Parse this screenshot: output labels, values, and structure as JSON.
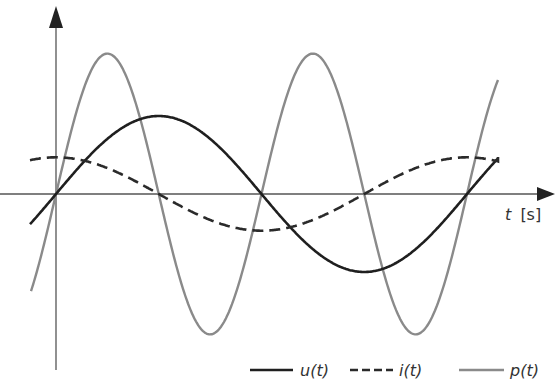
{
  "chart_data": {
    "type": "line",
    "title": "",
    "xlabel": "t [s]",
    "ylabel": "",
    "grid": false,
    "legend_position": "bottom-right",
    "x_range_periods": [
      -0.06,
      1.08
    ],
    "series": [
      {
        "name": "u(t)",
        "style": "solid",
        "color": "#1f1f1f",
        "function": "A·sin(ωt)",
        "amplitude": 1.0,
        "zero_crossings_periods": [
          0,
          0.5,
          1.0
        ]
      },
      {
        "name": "i(t)",
        "style": "dashed",
        "color": "#2a2a2a",
        "function": "B·cos(ωt)",
        "amplitude": 0.47,
        "zero_crossings_periods": [
          0.25,
          0.75
        ]
      },
      {
        "name": "p(t)",
        "style": "solid",
        "color": "#8a8a8a",
        "function": "C·sin(2ωt)",
        "amplitude": 1.8,
        "zero_crossings_periods": [
          0,
          0.25,
          0.5,
          0.75,
          1.0
        ]
      }
    ]
  },
  "axis": {
    "x_label_t": "t",
    "x_label_unit": "[s]"
  },
  "legend": {
    "u": "u(t)",
    "i": "i(t)",
    "p": "p(t)"
  },
  "colors": {
    "u": "#1f1f1f",
    "i": "#2a2a2a",
    "p": "#8a8a8a",
    "axis": "#555555"
  }
}
